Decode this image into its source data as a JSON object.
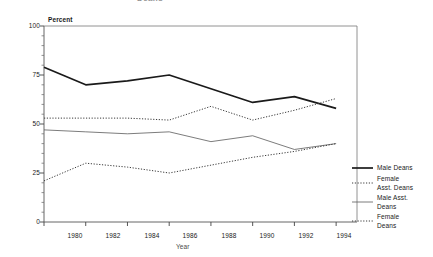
{
  "chart_data": {
    "type": "line",
    "title": "Deans",
    "xlabel": "Year",
    "ylabel": "Percent",
    "categories": [
      1980,
      1982,
      1984,
      1986,
      1988,
      1990,
      1992,
      1994
    ],
    "xlim": [
      1980,
      1995
    ],
    "ylim": [
      0,
      100
    ],
    "yticks": [
      0,
      25,
      50,
      75,
      100
    ],
    "ytick_labels": [
      "0",
      "25",
      "50",
      "75",
      "100"
    ],
    "xtick_labels": [
      "1980",
      "1982",
      "1984",
      "1986",
      "1988",
      "1990",
      "1992",
      "1994"
    ],
    "grid": false,
    "legend_position": "right",
    "minor_ticks": true,
    "series": [
      {
        "name": "Male Deans",
        "style": "solid-thick",
        "color": "#1a1a1a",
        "values": [
          79,
          70,
          72,
          75,
          68,
          61,
          64,
          58
        ]
      },
      {
        "name": "Female\nAsst. Deans",
        "style": "dotted",
        "color": "#3a3a3a",
        "values": [
          53,
          53,
          53,
          52,
          59,
          52,
          57,
          63
        ]
      },
      {
        "name": "Male Asst.\nDeans",
        "style": "solid-thin",
        "color": "#5a5a5a",
        "values": [
          47,
          46,
          45,
          46,
          41,
          44,
          37,
          40
        ]
      },
      {
        "name": "Female\nDeans",
        "style": "dotted",
        "color": "#3a3a3a",
        "values": [
          21,
          30,
          28,
          25,
          29,
          33,
          36,
          40
        ]
      }
    ]
  },
  "legend": {
    "entries": [
      {
        "label": "Male Deans",
        "swatch": "solid-thick"
      },
      {
        "label": "Female\nAsst. Deans",
        "swatch": "dotted"
      },
      {
        "label": "Male Asst.\nDeans",
        "swatch": "solid-thin"
      },
      {
        "label": "Female\nDeans",
        "swatch": "dotted"
      }
    ]
  }
}
